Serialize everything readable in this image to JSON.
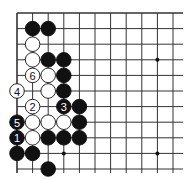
{
  "board": {
    "origin_x": 17,
    "origin_y": 13,
    "spacing": 15.6,
    "cols": 11,
    "rows": 11,
    "right_edge": 183,
    "bottom_edge": 173,
    "line_color": "#333333",
    "star_points": [
      [
        3,
        9
      ],
      [
        9,
        3
      ],
      [
        9,
        9
      ]
    ]
  },
  "stones": [
    {
      "c": 1,
      "r": 1,
      "color": "black"
    },
    {
      "c": 2,
      "r": 1,
      "color": "black"
    },
    {
      "c": 1,
      "r": 2,
      "color": "white"
    },
    {
      "c": 1,
      "r": 3,
      "color": "white"
    },
    {
      "c": 2,
      "r": 3,
      "color": "black"
    },
    {
      "c": 3,
      "r": 3,
      "color": "black"
    },
    {
      "c": 1,
      "r": 4,
      "color": "white",
      "label": "6"
    },
    {
      "c": 2,
      "r": 4,
      "color": "white"
    },
    {
      "c": 3,
      "r": 4,
      "color": "black"
    },
    {
      "c": 0,
      "r": 5,
      "color": "white",
      "label": "4"
    },
    {
      "c": 2,
      "r": 5,
      "color": "white"
    },
    {
      "c": 3,
      "r": 5,
      "color": "black"
    },
    {
      "c": 1,
      "r": 6,
      "color": "white",
      "label": "2"
    },
    {
      "c": 3,
      "r": 6,
      "color": "black",
      "label": "3"
    },
    {
      "c": 4,
      "r": 6,
      "color": "black"
    },
    {
      "c": 0,
      "r": 7,
      "color": "black",
      "label": "5"
    },
    {
      "c": 1,
      "r": 7,
      "color": "white"
    },
    {
      "c": 2,
      "r": 7,
      "color": "white"
    },
    {
      "c": 3,
      "r": 7,
      "color": "white"
    },
    {
      "c": 4,
      "r": 7,
      "color": "black"
    },
    {
      "c": 0,
      "r": 8,
      "color": "black",
      "label": "1"
    },
    {
      "c": 1,
      "r": 8,
      "color": "white"
    },
    {
      "c": 2,
      "r": 8,
      "color": "black"
    },
    {
      "c": 3,
      "r": 8,
      "color": "black"
    },
    {
      "c": 4,
      "r": 8,
      "color": "black"
    },
    {
      "c": 0,
      "r": 9,
      "color": "black"
    },
    {
      "c": 1,
      "r": 9,
      "color": "black"
    },
    {
      "c": 2,
      "r": 10,
      "color": "black"
    }
  ]
}
